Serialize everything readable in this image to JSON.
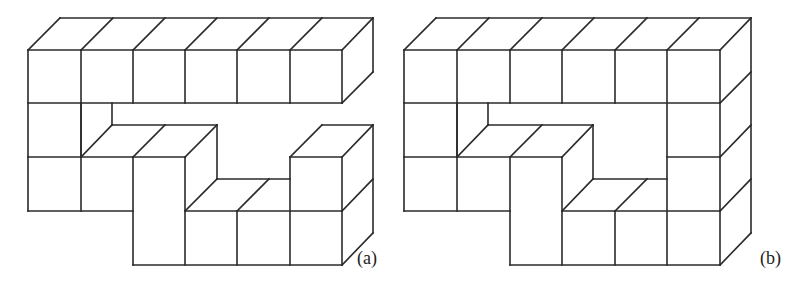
{
  "figures": [
    {
      "id": "a",
      "label": "(a)",
      "label_pos": [
        357,
        248
      ],
      "edges": [
        "28,50 342,50",
        "28,103 342,103",
        "28,50 28,211",
        "81,50 81,211",
        "133,50 133,103",
        "185,50 185,103",
        "237,50 237,103",
        "290,50 290,103",
        "342,50 342,103",
        "28,50 60,18",
        "81,50 113,18",
        "133,50 165,18",
        "185,50 217,18",
        "237,50 269,18",
        "290,50 322,18",
        "342,50 373,18",
        "60,18 373,18",
        "373,18 373,72",
        "342,103 373,72",
        "81,103 81,157",
        "112,103 112,125",
        "112,125 217,125",
        "81,157 112,125",
        "133,157 165,125",
        "185,157 217,125",
        "217,125 217,179",
        "185,211 217,179",
        "28,157 185,157",
        "133,157 133,265",
        "185,157 185,265",
        "28,211 133,211",
        "133,265 342,265",
        "185,211 342,211",
        "217,179 290,179",
        "237,211 269,179",
        "290,157 290,265",
        "290,157 342,157",
        "342,157 342,265",
        "290,157 322,125",
        "342,157 373,125",
        "322,125 373,125",
        "373,125 373,233",
        "342,211 373,179",
        "342,265 373,233",
        "237,211 237,265"
      ]
    },
    {
      "id": "b",
      "label": "(b)",
      "label_pos": [
        760,
        248
      ],
      "edges": [
        "404,50 720,50",
        "404,103 720,103",
        "404,50 404,211",
        "457,50 457,211",
        "510,50 510,103",
        "562,50 562,103",
        "615,50 615,103",
        "667,50 667,265",
        "720,50 720,265",
        "404,50 436,18",
        "457,50 489,18",
        "510,50 542,18",
        "562,50 594,18",
        "615,50 647,18",
        "667,50 699,18",
        "720,50 751,18",
        "436,18 751,18",
        "751,18 751,233",
        "720,103 751,72",
        "720,157 751,125",
        "720,211 751,179",
        "720,265 751,233",
        "457,103 457,157",
        "488,103 488,125",
        "488,125 593,125",
        "457,157 488,125",
        "510,157 542,125",
        "562,157 593,125",
        "593,125 593,179",
        "562,211 593,179",
        "404,157 562,157",
        "510,157 510,265",
        "562,157 562,265",
        "404,211 510,211",
        "510,265 720,265",
        "562,211 720,211",
        "593,179 667,179",
        "615,211 647,179",
        "667,157 720,157",
        "615,211 615,265"
      ]
    }
  ]
}
